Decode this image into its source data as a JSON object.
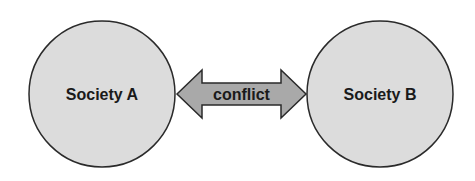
{
  "diagram": {
    "nodes": [
      {
        "id": "society-a",
        "label": "Society A",
        "fill": "#dcdcdc",
        "stroke": "#2a2a2a"
      },
      {
        "id": "society-b",
        "label": "Society B",
        "fill": "#dcdcdc",
        "stroke": "#2a2a2a"
      }
    ],
    "edge": {
      "label": "conflict",
      "type": "double-headed-arrow",
      "from": "society-a",
      "to": "society-b",
      "fill": "#a9a9a9",
      "stroke": "#2a2a2a"
    }
  }
}
